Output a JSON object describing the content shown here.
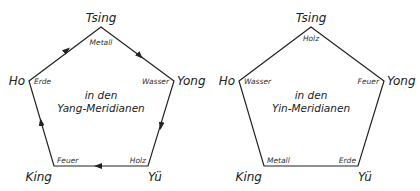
{
  "diagrams": [
    {
      "id": "yang",
      "center_label": [
        "in den",
        "Yang-Meridianen"
      ],
      "vertices": {
        "top": "Tsing",
        "left": "Ho",
        "right": "Yong",
        "bottom_left": "King",
        "bottom_right": "Yü"
      },
      "elements": {
        "top": "Metall",
        "left": "Erde",
        "right": "Wasser",
        "bottom_left": "Feuer",
        "bottom_right": "Holz"
      },
      "arrows": true
    },
    {
      "id": "yin",
      "center_label": [
        "in den",
        "Yin-Meridianen"
      ],
      "vertices": {
        "top": "Tsing",
        "left": "Ho",
        "right": "Yong",
        "bottom_left": "King",
        "bottom_right": "Yü"
      },
      "elements": {
        "top": "Holz",
        "left": "Wasser",
        "right": "Feuer",
        "bottom_left": "Metall",
        "bottom_right": "Erde"
      },
      "arrows": false
    }
  ]
}
